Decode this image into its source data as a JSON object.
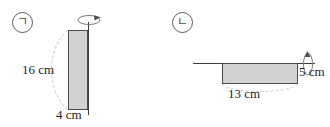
{
  "diagram": {
    "background_color": "#ffffff",
    "figures": [
      {
        "marker": "ㄱ",
        "marker_name": "figure-label-giyeok",
        "axis": "vertical",
        "axis_name": "axis-of-rotation-vertical",
        "shape": "rectangle",
        "fill_color": "#d2d2d2",
        "stroke_color": "#4b4b4b",
        "dimensions": [
          {
            "label": "16 cm",
            "value": 16,
            "unit": "cm",
            "side": "height"
          },
          {
            "label": "4 cm",
            "value": 4,
            "unit": "cm",
            "side": "width"
          }
        ],
        "rotation_arrow": "rotation-arrow-icon"
      },
      {
        "marker": "ㄴ",
        "marker_name": "figure-label-nieun",
        "axis": "horizontal",
        "axis_name": "axis-of-rotation-horizontal",
        "shape": "rectangle",
        "fill_color": "#d2d2d2",
        "stroke_color": "#4b4b4b",
        "dimensions": [
          {
            "label": "13 cm",
            "value": 13,
            "unit": "cm",
            "side": "width"
          },
          {
            "label": "5 cm",
            "value": 5,
            "unit": "cm",
            "side": "height"
          }
        ],
        "rotation_arrow": "rotation-arrow-icon"
      }
    ]
  }
}
